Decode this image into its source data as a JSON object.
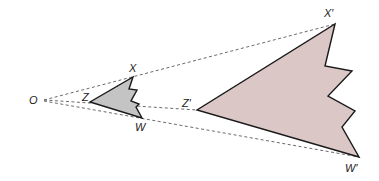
{
  "diagram": {
    "type": "dilation",
    "center": {
      "label": "O",
      "x": 40,
      "y": 100
    },
    "preimage": {
      "fill": "#c4c4c4",
      "vertices": [
        {
          "label": "X",
          "x": 133,
          "y": 77
        },
        {
          "label": "W",
          "x": 142,
          "y": 118
        },
        {
          "label": "Z",
          "x": 90,
          "y": 102
        }
      ],
      "outline": "133,77 129,89 137,90 131,101 139,104 136,107 142,118 90,102"
    },
    "image": {
      "fill": "#dcc7c7",
      "vertices": [
        {
          "label": "X'",
          "x": 335,
          "y": 24
        },
        {
          "label": "W'",
          "x": 359,
          "y": 157
        },
        {
          "label": "Z'",
          "x": 197,
          "y": 110
        }
      ],
      "outline": "335,24 325,66 352,71 328,96 355,111 342,127 359,157 197,110"
    },
    "labels": {
      "O": "O",
      "X": "X",
      "Z": "Z",
      "W": "W",
      "X_prime": "X′",
      "Z_prime": "Z′",
      "W_prime": "W′"
    }
  }
}
